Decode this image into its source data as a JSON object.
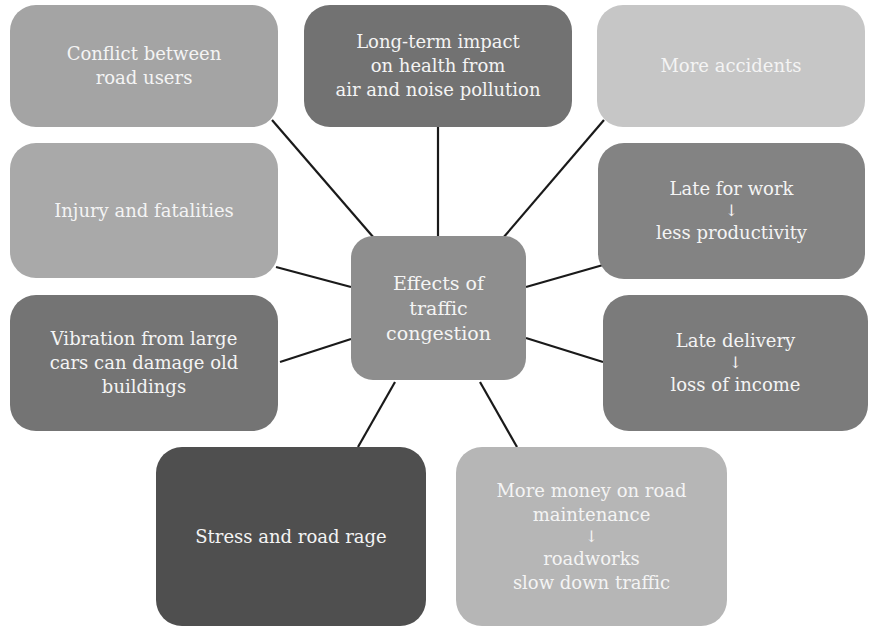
{
  "diagram": {
    "type": "mind-map",
    "center": {
      "id": "center",
      "lines": [
        "Effects of",
        "traffic",
        "congestion"
      ],
      "color": "#8e8e8e"
    },
    "effects": [
      {
        "id": "conflict",
        "lines": [
          "Conflict between",
          "road users"
        ],
        "color": "#a4a4a4"
      },
      {
        "id": "health",
        "lines": [
          "Long-term impact",
          "on health from",
          "air and noise pollution"
        ],
        "color": "#727272"
      },
      {
        "id": "accidents",
        "lines": [
          "More accidents"
        ],
        "color": "#c6c6c6"
      },
      {
        "id": "injury",
        "lines": [
          "Injury and fatalities"
        ],
        "color": "#a9a9a9"
      },
      {
        "id": "late-work",
        "lines": [
          "Late for work"
        ],
        "arrow": "↓",
        "after": [
          "less productivity"
        ],
        "color": "#838383"
      },
      {
        "id": "vibration",
        "lines": [
          "Vibration from large",
          "cars can damage old",
          "buildings"
        ],
        "color": "#747474"
      },
      {
        "id": "late-delivery",
        "lines": [
          "Late delivery"
        ],
        "arrow": "↓",
        "after": [
          "loss of income"
        ],
        "color": "#7b7b7b"
      },
      {
        "id": "stress",
        "lines": [
          "Stress and road rage"
        ],
        "color": "#4f4f4f"
      },
      {
        "id": "road-money",
        "lines": [
          "More money on road",
          "maintenance"
        ],
        "arrow": "↓",
        "after": [
          "roadworks",
          "slow down traffic"
        ],
        "color": "#b6b6b6"
      }
    ],
    "connector_color": "#1a1a1a"
  }
}
